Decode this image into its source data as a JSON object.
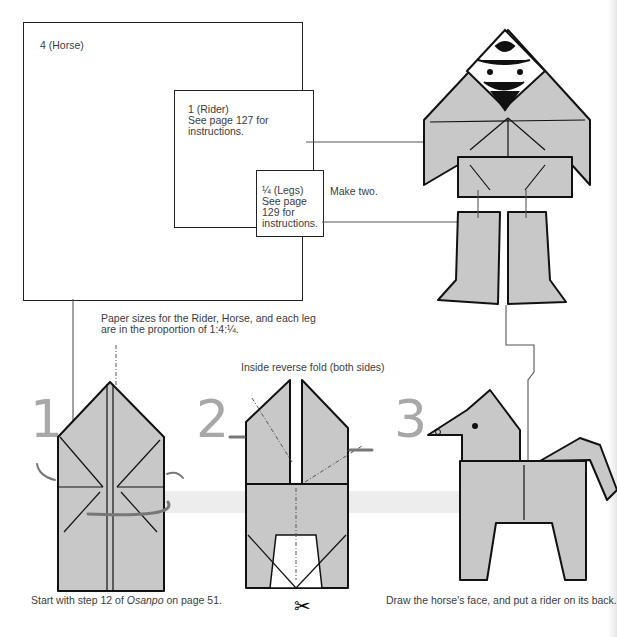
{
  "paper_sizes": {
    "horse": {
      "label": "4 (Horse)"
    },
    "rider": {
      "label": "1 (Rider)",
      "note": "See page 127 for\ninstructions."
    },
    "legs": {
      "label": "¼ (Legs)",
      "note": "See page\n129 for\ninstructions.",
      "extra": "Make two."
    }
  },
  "proportion_note": "Paper sizes for the Rider, Horse, and each leg\nare in the proportion of 1:4:¼.",
  "steps": [
    {
      "number": "1",
      "caption_parts": [
        "Start with step 12 of ",
        "Osanpo",
        " on page 51."
      ]
    },
    {
      "number": "2",
      "instruction": "Inside reverse fold (both sides)",
      "icon": "scissors-icon"
    },
    {
      "number": "3",
      "caption": "Draw the horse's face, and put a rider on its back."
    }
  ],
  "colors": {
    "paper_fill": "#c8c8c8",
    "step_number": "#a8a8a8",
    "band": "#ececec",
    "arrow": "#777777"
  }
}
